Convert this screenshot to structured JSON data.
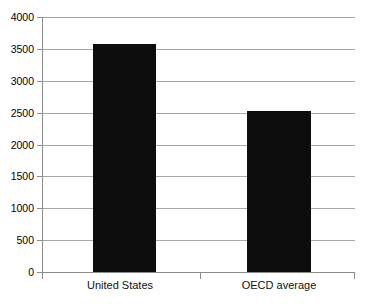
{
  "chart_data": {
    "type": "bar",
    "title": "",
    "subtitle": "",
    "xlabel": "",
    "ylabel": "",
    "categories": [
      "United States",
      "OECD average"
    ],
    "values": [
      3570,
      2520
    ],
    "series": [
      {
        "name": "",
        "values": [
          3570,
          2520
        ]
      }
    ],
    "ylim": [
      0,
      4000
    ],
    "yticks": [
      0,
      500,
      1000,
      1500,
      2000,
      2500,
      3000,
      3500,
      4000
    ],
    "ytick_labels": [
      "0",
      "500",
      "1000",
      "1500",
      "2000",
      "2500",
      "3000",
      "3500",
      "4000"
    ],
    "grid": true,
    "grid_axis": "y",
    "legend": false,
    "legend_position": "none",
    "bar_color": "#0d0d0d",
    "gridline_color": "#a8a8a8",
    "axis_color": "#8c8c8c",
    "background_color": "#ffffff",
    "annotations": []
  },
  "axis": {
    "y_labels": [
      "4000",
      "3500",
      "3000",
      "2500",
      "2000",
      "1500",
      "1000",
      "500",
      "0"
    ],
    "x_labels": [
      "United States",
      "OECD average"
    ]
  },
  "footer": {
    "clipped_caption": ""
  }
}
